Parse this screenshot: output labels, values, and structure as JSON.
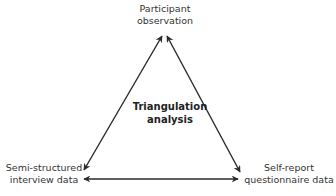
{
  "diagram": {
    "type": "triangle",
    "nodes": {
      "top": {
        "line1": "Participant",
        "line2": "observation"
      },
      "bottom_left": {
        "line1": "Semi-structured",
        "line2": "interview data"
      },
      "bottom_right": {
        "line1": "Self-report",
        "line2": "questionnaire data"
      },
      "center": {
        "line1": "Triangulation",
        "line2": "analysis"
      }
    },
    "edges": [
      {
        "from": "top",
        "to": "bottom_left",
        "bidirectional": true
      },
      {
        "from": "top",
        "to": "bottom_right",
        "bidirectional": true
      },
      {
        "from": "bottom_left",
        "to": "bottom_right",
        "bidirectional": true
      }
    ],
    "arrow_color": "#2a2a2a"
  }
}
